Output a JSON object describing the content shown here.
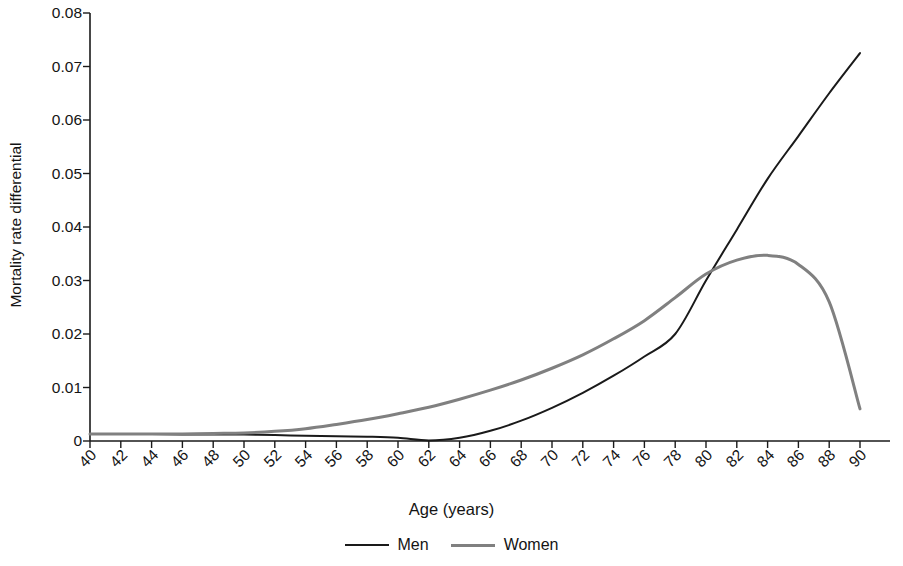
{
  "chart_data": {
    "type": "line",
    "title": "",
    "xlabel": "Age (years)",
    "ylabel": "Mortality rate differential",
    "xlim": [
      40,
      90
    ],
    "ylim": [
      0,
      0.08
    ],
    "xticks": [
      40,
      42,
      44,
      46,
      48,
      50,
      52,
      54,
      56,
      58,
      60,
      62,
      64,
      66,
      68,
      70,
      72,
      74,
      76,
      78,
      80,
      82,
      84,
      86,
      88,
      90
    ],
    "xtick_labels": [
      "40",
      "42",
      "44",
      "46",
      "48",
      "50",
      "52",
      "54",
      "56",
      "58",
      "60",
      "62",
      "64",
      "66",
      "68",
      "70",
      "72",
      "74",
      "76",
      "78",
      "80",
      "82",
      "84",
      "86",
      "88",
      "90"
    ],
    "yticks": [
      0,
      0.01,
      0.02,
      0.03,
      0.04,
      0.05,
      0.06,
      0.07,
      0.08
    ],
    "ytick_labels": [
      "0",
      "0.01",
      "0.02",
      "0.03",
      "0.04",
      "0.05",
      "0.06",
      "0.07",
      "0.08"
    ],
    "grid": false,
    "legend_position": "bottom-center",
    "x": [
      40,
      42,
      44,
      46,
      48,
      50,
      52,
      54,
      56,
      58,
      60,
      62,
      64,
      66,
      68,
      70,
      72,
      74,
      76,
      78,
      80,
      82,
      84,
      86,
      88,
      90
    ],
    "series": [
      {
        "name": "Men",
        "color": "#1a1a1a",
        "values": [
          0.0013,
          0.0013,
          0.0013,
          0.0012,
          0.0012,
          0.0012,
          0.0011,
          0.001,
          0.0009,
          0.0008,
          0.0006,
          0.0001,
          0.0006,
          0.0019,
          0.0038,
          0.0062,
          0.009,
          0.0122,
          0.0158,
          0.02,
          0.03,
          0.0395,
          0.049,
          0.057,
          0.065,
          0.0725
        ]
      },
      {
        "name": "Women",
        "color": "#808080",
        "values": [
          0.0013,
          0.0013,
          0.0013,
          0.0013,
          0.0014,
          0.0015,
          0.0018,
          0.0023,
          0.0031,
          0.004,
          0.0051,
          0.0063,
          0.0078,
          0.0095,
          0.0114,
          0.0136,
          0.0161,
          0.0191,
          0.0225,
          0.0268,
          0.0312,
          0.0338,
          0.0347,
          0.033,
          0.026,
          0.006
        ]
      }
    ],
    "legend": [
      {
        "label": "Men",
        "color": "#1a1a1a"
      },
      {
        "label": "Women",
        "color": "#808080"
      }
    ]
  },
  "axes": {
    "axis_color": "#1a1a1a"
  }
}
